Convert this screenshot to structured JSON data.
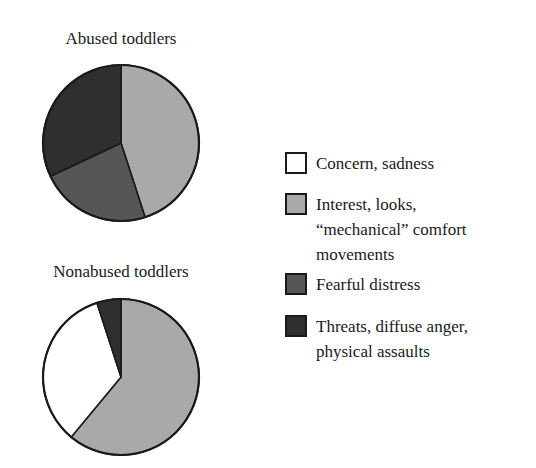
{
  "colors": {
    "concern": "#ffffff",
    "interest": "#a9a9a9",
    "fearful": "#565656",
    "threats": "#2f2f2f",
    "outline": "#1a1a1a"
  },
  "legend": {
    "position": "right",
    "items": [
      {
        "key": "concern",
        "label": "Concern, sadness",
        "color": "#ffffff"
      },
      {
        "key": "interest",
        "label": "Interest, looks,\n“mechanical” comfort\nmovements",
        "color": "#a9a9a9"
      },
      {
        "key": "fearful",
        "label": "Fearful distress",
        "color": "#565656"
      },
      {
        "key": "threats",
        "label": "Threats, diffuse anger,\nphysical assaults",
        "color": "#2f2f2f"
      }
    ]
  },
  "charts": {
    "top": {
      "title": "Abused toddlers"
    },
    "bottom": {
      "title": "Nonabused toddlers"
    }
  },
  "chart_data": [
    {
      "type": "pie",
      "title": "Abused toddlers",
      "start_angle": "12 o'clock, clockwise",
      "categories": [
        "Interest, looks, “mechanical” comfort movements",
        "Fearful distress",
        "Threats, diffuse anger, physical assaults"
      ],
      "keys": [
        "interest",
        "fearful",
        "threats"
      ],
      "values": [
        45,
        23,
        32
      ],
      "unit": "%"
    },
    {
      "type": "pie",
      "title": "Nonabused toddlers",
      "start_angle": "12 o'clock, clockwise",
      "categories": [
        "Interest, looks, “mechanical” comfort movements",
        "Concern, sadness",
        "Threats, diffuse anger, physical assaults"
      ],
      "keys": [
        "interest",
        "concern",
        "threats"
      ],
      "values": [
        61,
        34,
        5
      ],
      "unit": "%"
    }
  ]
}
